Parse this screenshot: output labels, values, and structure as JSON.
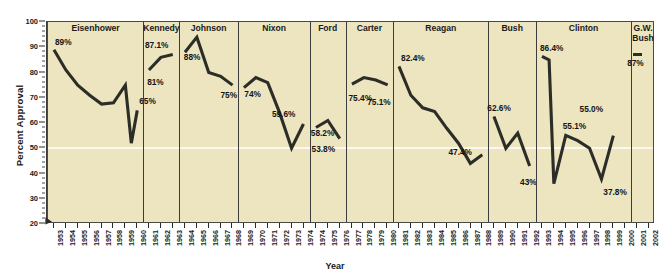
{
  "chart_data": {
    "type": "line",
    "title": "",
    "xlabel": "Year",
    "ylabel": "Percent Approval",
    "ylim": [
      20,
      100
    ],
    "ytick_labels": [
      "20",
      "30",
      "40",
      "50",
      "60",
      "70",
      "80",
      "90",
      "100"
    ],
    "ytick_values": [
      20,
      30,
      40,
      50,
      60,
      70,
      80,
      90,
      100
    ],
    "grid": "single white horizontal gridline at 50",
    "legend": "none",
    "plot_background": "#ece5c0",
    "line_color": "#2d2d28",
    "panels": [
      {
        "name": "Eisenhower",
        "years": [
          "1953",
          "1954",
          "1955",
          "1956",
          "1957",
          "1958",
          "1959",
          "1960"
        ],
        "values": [
          89,
          81,
          75,
          71,
          67.5,
          68,
          75,
          52,
          65
        ],
        "series_years": [
          "1953",
          "1954",
          "1955",
          "1956",
          "1957",
          "1958",
          "1959",
          "1959.5",
          "1960"
        ],
        "labels": [
          {
            "text": "89%",
            "year": "1953",
            "value": 89
          },
          {
            "text": "65%",
            "year": "1960",
            "value": 65
          }
        ]
      },
      {
        "name": "Kennedy",
        "years": [
          "1961",
          "1962",
          "1963"
        ],
        "values": [
          81,
          86,
          87.1
        ],
        "series_years": [
          "1961",
          "1962",
          "1963"
        ],
        "labels": [
          {
            "text": "87.1%",
            "year": "1963",
            "value": 87.1
          },
          {
            "text": "81%",
            "year": "1961",
            "value": 81
          }
        ]
      },
      {
        "name": "Johnson",
        "years": [
          "1964",
          "1965",
          "1966",
          "1967",
          "1968"
        ],
        "values": [
          88,
          94,
          80,
          78.5,
          75
        ],
        "series_years": [
          "1964",
          "1965",
          "1966",
          "1967",
          "1968"
        ],
        "labels": [
          {
            "text": "88%",
            "year": "1964",
            "value": 88
          },
          {
            "text": "75%",
            "year": "1968",
            "value": 75
          }
        ]
      },
      {
        "name": "Nixon",
        "years": [
          "1969",
          "1970",
          "1971",
          "1972",
          "1973",
          "1974"
        ],
        "values": [
          74,
          78,
          76,
          64,
          50,
          59.6
        ],
        "series_years": [
          "1969",
          "1970",
          "1971",
          "1972",
          "1973",
          "1974"
        ],
        "labels": [
          {
            "text": "74%",
            "year": "1969",
            "value": 74
          },
          {
            "text": "59.6%",
            "year": "1974",
            "value": 59.6
          }
        ]
      },
      {
        "name": "Ford",
        "years": [
          "1974",
          "1975",
          "1976"
        ],
        "values": [
          58.2,
          61,
          53.8
        ],
        "series_years": [
          "1974",
          "1975",
          "1976"
        ],
        "labels": [
          {
            "text": "58.2%",
            "year": "1974",
            "value": 58.2
          },
          {
            "text": "53.8%",
            "year": "1976",
            "value": 53.8
          }
        ]
      },
      {
        "name": "Carter",
        "years": [
          "1977",
          "1978",
          "1979",
          "1980"
        ],
        "values": [
          75.4,
          78,
          77,
          75.1
        ],
        "series_years": [
          "1977",
          "1978",
          "1979",
          "1980"
        ],
        "labels": [
          {
            "text": "75.4%",
            "year": "1977",
            "value": 75.4
          },
          {
            "text": "75.1%",
            "year": "1980",
            "value": 75.1
          }
        ]
      },
      {
        "name": "Reagan",
        "years": [
          "1981",
          "1982",
          "1983",
          "1984",
          "1985",
          "1986",
          "1987",
          "1988"
        ],
        "values": [
          82.4,
          71,
          66,
          64.5,
          58,
          52,
          44,
          47.4
        ],
        "series_years": [
          "1981",
          "1982",
          "1983",
          "1984",
          "1985",
          "1986",
          "1987",
          "1988"
        ],
        "labels": [
          {
            "text": "82.4%",
            "year": "1981",
            "value": 82.4
          },
          {
            "text": "47.4%",
            "year": "1988",
            "value": 47.4
          }
        ]
      },
      {
        "name": "Bush",
        "years": [
          "1989",
          "1990",
          "1991",
          "1992"
        ],
        "values": [
          62.6,
          50,
          56,
          43
        ],
        "series_years": [
          "1989",
          "1990",
          "1991",
          "1992"
        ],
        "labels": [
          {
            "text": "62.6%",
            "year": "1989",
            "value": 62.6
          },
          {
            "text": "43%",
            "year": "1992",
            "value": 43
          }
        ]
      },
      {
        "name": "Clinton",
        "years": [
          "1993",
          "1994",
          "1995",
          "1996",
          "1997",
          "1998",
          "1999",
          "2000"
        ],
        "values": [
          86.4,
          85,
          36,
          55.1,
          53,
          50,
          37.8,
          55
        ],
        "series_years": [
          "1993",
          "1993.6",
          "1994",
          "1995",
          "1996",
          "1997",
          "1998",
          "1999",
          "2000"
        ],
        "labels": [
          {
            "text": "86.4%",
            "year": "1993",
            "value": 86.4
          },
          {
            "text": "55.1%",
            "year": "1995",
            "value": 55.1
          },
          {
            "text": "55.0%",
            "year": "1997",
            "value": 55.0
          },
          {
            "text": "37.8%",
            "year": "1999",
            "value": 37.8
          }
        ]
      },
      {
        "name": "G.W. Bush",
        "name_lines": [
          "G.W.",
          "Bush"
        ],
        "years": [
          "2001",
          "2002"
        ],
        "values": [
          87
        ],
        "series_years": [
          "2001"
        ],
        "labels": [
          {
            "text": "87%",
            "year": "2001",
            "value": 87
          }
        ]
      }
    ],
    "all_years": [
      "1953",
      "1954",
      "1955",
      "1956",
      "1957",
      "1958",
      "1959",
      "1960",
      "1961",
      "1962",
      "1963",
      "1964",
      "1965",
      "1966",
      "1967",
      "1968",
      "1969",
      "1970",
      "1971",
      "1972",
      "1973",
      "1974",
      "1974",
      "1975",
      "1976",
      "1977",
      "1978",
      "1979",
      "1980",
      "1981",
      "1982",
      "1983",
      "1984",
      "1985",
      "1986",
      "1987",
      "1988",
      "1989",
      "1990",
      "1991",
      "1992",
      "1993",
      "1994",
      "1995",
      "1996",
      "1997",
      "1998",
      "1999",
      "2000",
      "2001",
      "2002"
    ]
  }
}
